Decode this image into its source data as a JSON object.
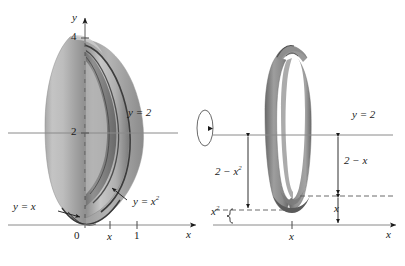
{
  "figure": {
    "background": "#ffffff",
    "ink": "#1a1a1a",
    "axis_color": "#8a8a8a",
    "solid_fill_light": "#b9b9b9",
    "solid_fill_mid": "#9a9a9a",
    "solid_fill_dark": "#6f6f6f",
    "ring_fill": "#8d8d8d",
    "ring_fill_dark": "#5e5e5e"
  },
  "left_panel": {
    "name": "solid-of-revolution-3d",
    "y_axis_label": "y",
    "x_axis_label": "x",
    "y_ticks": [
      {
        "label": "4",
        "value": 4
      },
      {
        "label": "2",
        "value": 2
      }
    ],
    "x_ticks": [
      {
        "label": "0",
        "value": 0
      },
      {
        "label": "x",
        "value": 0.5
      },
      {
        "label": "1",
        "value": 1
      }
    ],
    "axis_of_revolution_label": "y = 2",
    "curve_labels": [
      {
        "name": "line-y-equals-x",
        "text": "y = x"
      },
      {
        "name": "parabola-y-equals-x-squared",
        "text": "y = x",
        "exponent": "2"
      }
    ]
  },
  "rotation_marker": {
    "name": "rotation-arrow",
    "description": "ellipse with arrowhead indicating revolution"
  },
  "right_panel": {
    "name": "washer-cross-section",
    "x_axis_label": "x",
    "axis_line_label": "y = 2",
    "x_tick_label": "x",
    "dimensions": [
      {
        "name": "outer-radius",
        "text": "2 − x",
        "exponent": "2",
        "value": "2 - x^2"
      },
      {
        "name": "inner-radius",
        "text": "2 − x",
        "exponent": "",
        "value": "2 - x"
      },
      {
        "name": "height-x-squared",
        "text": "x",
        "exponent": "2",
        "value": "x^2"
      },
      {
        "name": "height-x",
        "text": "x",
        "exponent": "",
        "value": "x"
      }
    ]
  }
}
